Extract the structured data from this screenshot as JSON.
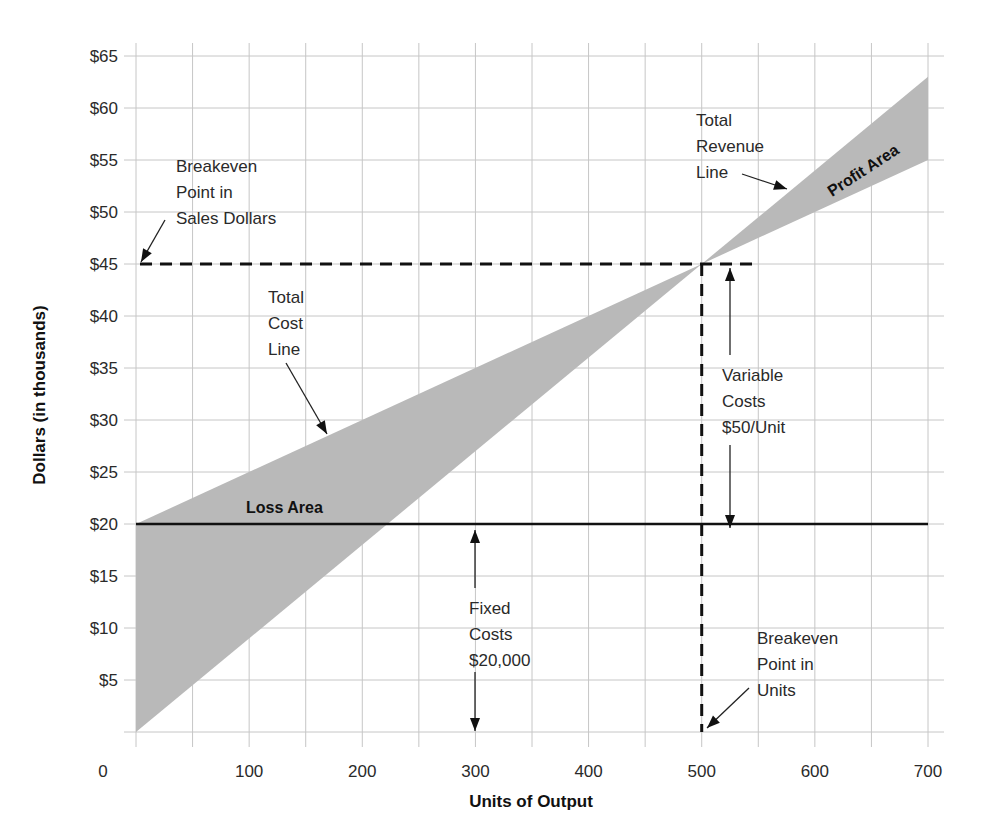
{
  "chart_data": {
    "type": "line",
    "title": "",
    "xlabel": "Units of Output",
    "ylabel": "Dollars (in thousands)",
    "xlim": [
      0,
      700
    ],
    "ylim": [
      0,
      65
    ],
    "grid": true,
    "x_ticks": [
      {
        "value": 0,
        "label": "0"
      },
      {
        "value": 100,
        "label": "100"
      },
      {
        "value": 200,
        "label": "200"
      },
      {
        "value": 300,
        "label": "300"
      },
      {
        "value": 400,
        "label": "400"
      },
      {
        "value": 500,
        "label": "500"
      },
      {
        "value": 600,
        "label": "600"
      },
      {
        "value": 700,
        "label": "700"
      }
    ],
    "x_minor_step": 50,
    "y_ticks": [
      {
        "value": 5,
        "label": "$5"
      },
      {
        "value": 10,
        "label": "$10"
      },
      {
        "value": 15,
        "label": "$15"
      },
      {
        "value": 20,
        "label": "$20"
      },
      {
        "value": 25,
        "label": "$25"
      },
      {
        "value": 30,
        "label": "$30"
      },
      {
        "value": 35,
        "label": "$35"
      },
      {
        "value": 40,
        "label": "$40"
      },
      {
        "value": 45,
        "label": "$45"
      },
      {
        "value": 50,
        "label": "$50"
      },
      {
        "value": 55,
        "label": "$55"
      },
      {
        "value": 60,
        "label": "$60"
      },
      {
        "value": 65,
        "label": "$65"
      }
    ],
    "series": [
      {
        "name": "Total Revenue Line",
        "x": [
          0,
          500,
          700
        ],
        "y": [
          0,
          45,
          63
        ]
      },
      {
        "name": "Total Cost Line",
        "x": [
          0,
          500,
          700
        ],
        "y": [
          20,
          45,
          55
        ]
      },
      {
        "name": "Fixed Costs",
        "x": [
          0,
          700
        ],
        "y": [
          20,
          20
        ]
      }
    ],
    "breakeven": {
      "units": 500,
      "dollars": 45
    },
    "areas": [
      {
        "name": "Loss Area",
        "label": "Loss Area"
      },
      {
        "name": "Profit Area",
        "label": "Profit Area"
      }
    ],
    "annotations": [
      {
        "id": "breakeven-sales",
        "lines": [
          "Breakeven",
          "Point in",
          "Sales Dollars"
        ]
      },
      {
        "id": "total-revenue",
        "lines": [
          "Total",
          "Revenue",
          "Line"
        ]
      },
      {
        "id": "total-cost",
        "lines": [
          "Total",
          "Cost",
          "Line"
        ]
      },
      {
        "id": "variable-costs",
        "lines": [
          "Variable",
          "Costs",
          "$50/Unit"
        ]
      },
      {
        "id": "fixed-costs",
        "lines": [
          "Fixed",
          "Costs",
          "$20,000"
        ]
      },
      {
        "id": "breakeven-units",
        "lines": [
          "Breakeven",
          "Point in",
          "Units"
        ]
      }
    ],
    "colors": {
      "region_fill": "#b9b9b9",
      "grid": "#c6c6c6",
      "lines": "#111111"
    }
  }
}
